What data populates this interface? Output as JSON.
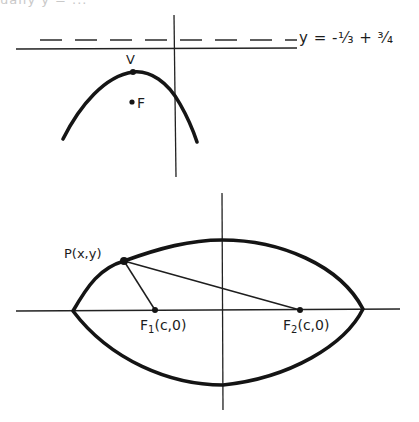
{
  "header": {
    "cut_off_text": "ually y = ..."
  },
  "figure_top": {
    "name": "parabola opening downward",
    "directrix_label": "y = -¹⁄₃ + ³⁄₄",
    "vertex_label": "V",
    "focus_label": "F",
    "elements": {
      "x_axis": {
        "x1": 16,
        "y1": 49,
        "x2": 297,
        "y2": 49
      },
      "y_axis": {
        "x1": 174,
        "y1": 15,
        "x2": 176,
        "y2": 177
      },
      "directrix_dashed": {
        "x1": 40,
        "y1": 40,
        "x2": 297,
        "y2": 40
      },
      "vertex": {
        "x": 133,
        "y": 72
      },
      "focus": {
        "x": 132,
        "y": 102
      },
      "parabola_left_end": {
        "x": 63,
        "y": 139
      },
      "parabola_right_end": {
        "x": 197,
        "y": 142
      }
    }
  },
  "figure_bottom": {
    "name": "ellipse with foci",
    "point_label": "P(x,y)",
    "focus1_label": "F",
    "focus1_sub": "1",
    "focus1_coords": "(c,0)",
    "focus2_label": "F",
    "focus2_sub": "2",
    "focus2_coords": "(c,0)",
    "elements": {
      "x_axis": {
        "x1": 16,
        "y1": 311,
        "x2": 400,
        "y2": 309
      },
      "y_axis": {
        "x1": 222,
        "y1": 193,
        "x2": 223,
        "y2": 410
      },
      "left_vertex": {
        "x": 73,
        "y": 311
      },
      "right vertex": {
        "x": 363,
        "y": 309
      },
      "top": {
        "x": 222,
        "y": 240
      },
      "bottom": {
        "x": 223,
        "y": 385
      },
      "point_p": {
        "x": 124,
        "y": 261
      },
      "focus1": {
        "x": 155,
        "y": 310
      },
      "focus2": {
        "x": 300,
        "y": 310
      }
    }
  },
  "colors": {
    "ink": "#1a1a1a",
    "paper": "#ffffff"
  }
}
